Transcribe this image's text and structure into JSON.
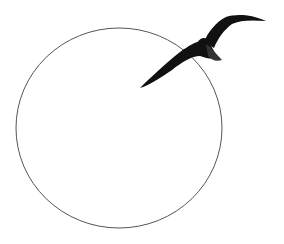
{
  "scene": {
    "description": "Line drawing of a circle with a soaring black seabird overlapping its upper-right edge",
    "background": "#ffffff",
    "circle": {
      "cx": 119,
      "cy": 128,
      "rx": 103,
      "ry": 100,
      "stroke": "#555555"
    },
    "bird": {
      "color": "#111111"
    }
  }
}
